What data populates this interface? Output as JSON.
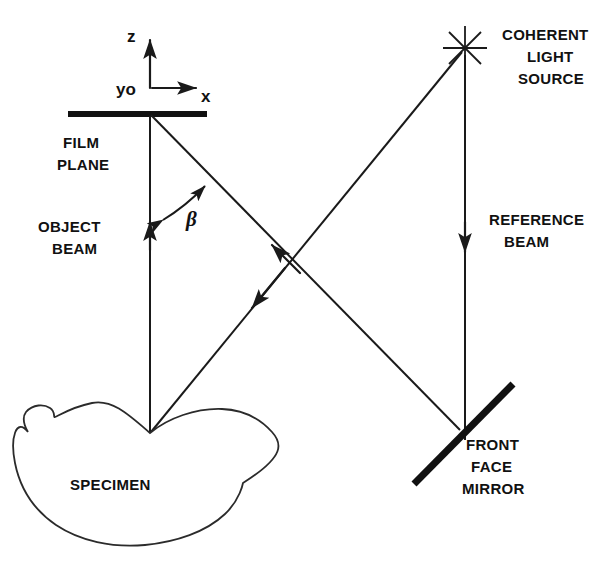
{
  "diagram": {
    "background_color": "#ffffff",
    "line_color": "#1a1a1a",
    "labels": {
      "axis_z": "z",
      "axis_x": "x",
      "axis_origin": "yo",
      "film_plane_line1": "FILM",
      "film_plane_line2": "PLANE",
      "object_beam_line1": "OBJECT",
      "object_beam_line2": "BEAM",
      "beta_angle": "β",
      "specimen": "SPECIMEN",
      "coherent_source_line1": "COHERENT",
      "coherent_source_line2": "LIGHT",
      "coherent_source_line3": "SOURCE",
      "reference_beam_line1": "REFERENCE",
      "reference_beam_line2": "BEAM",
      "mirror_line1": "FRONT",
      "mirror_line2": "FACE",
      "mirror_line3": "MIRROR"
    },
    "components": [
      {
        "name": "film-plane",
        "type": "plane",
        "label": "FILM PLANE"
      },
      {
        "name": "specimen",
        "type": "object",
        "label": "SPECIMEN"
      },
      {
        "name": "coherent-light-source",
        "type": "source",
        "label": "COHERENT LIGHT SOURCE"
      },
      {
        "name": "front-face-mirror",
        "type": "mirror",
        "label": "FRONT FACE MIRROR"
      }
    ],
    "beams": [
      {
        "name": "object-beam",
        "label": "OBJECT BEAM",
        "from": "specimen",
        "to": "film-plane"
      },
      {
        "name": "reference-beam",
        "label": "REFERENCE BEAM",
        "from": "coherent-light-source",
        "to": "front-face-mirror"
      },
      {
        "name": "mirror-to-film-beam",
        "from": "front-face-mirror",
        "to": "film-plane"
      },
      {
        "name": "source-to-specimen-beam",
        "from": "coherent-light-source",
        "to": "specimen"
      }
    ],
    "angles": [
      {
        "name": "beta",
        "symbol": "β",
        "between": [
          "object-beam",
          "mirror-to-film-beam"
        ]
      }
    ],
    "axes": [
      {
        "name": "z-axis",
        "label": "z",
        "direction": "up"
      },
      {
        "name": "x-axis",
        "label": "x",
        "direction": "right"
      },
      {
        "name": "y-axis",
        "label": "yo",
        "direction": "out-of-page"
      }
    ]
  }
}
